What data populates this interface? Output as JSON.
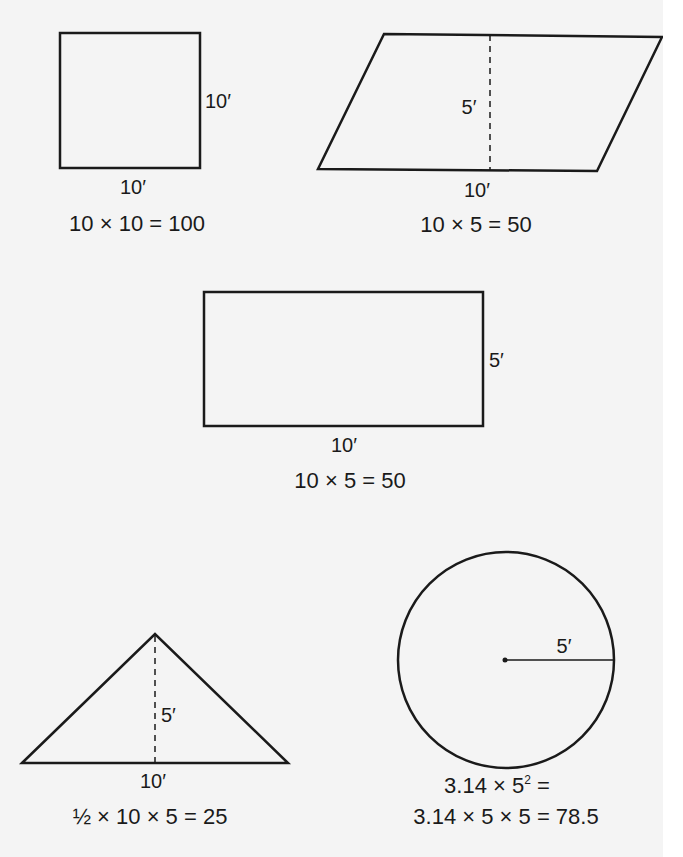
{
  "diagram": {
    "figures": [
      {
        "shape": "square",
        "labels": {
          "side": "10′",
          "base": "10′"
        },
        "equation": "10 × 10 = 100"
      },
      {
        "shape": "parallelogram",
        "labels": {
          "height": "5′",
          "base": "10′"
        },
        "equation": "10 × 5 = 50"
      },
      {
        "shape": "rectangle",
        "labels": {
          "side": "5′",
          "base": "10′"
        },
        "equation": "10 × 5 = 50"
      },
      {
        "shape": "triangle",
        "labels": {
          "height": "5′",
          "base": "10′"
        },
        "equation": "½ × 10 × 5 = 25"
      },
      {
        "shape": "circle",
        "labels": {
          "radius": "5′"
        },
        "equation_line1_prefix": "3.14 × 5",
        "equation_line1_exponent": "2",
        "equation_line1_suffix": " =",
        "equation_line2": "3.14 × 5 × 5 = 78.5"
      }
    ],
    "colors": {
      "background": "#f4f4f4",
      "stroke": "#1a1a1a",
      "margin": "#ffffff"
    }
  }
}
